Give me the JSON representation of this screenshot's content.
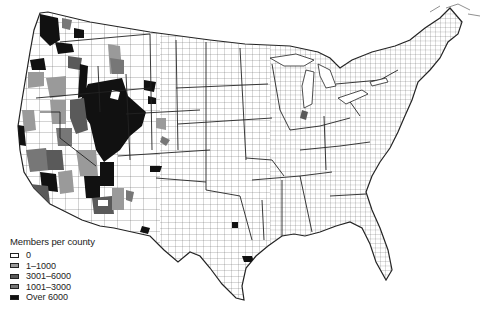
{
  "map": {
    "subject": "Members per county",
    "region": "Contiguous United States, county boundaries"
  },
  "legend": {
    "title": "Members per county",
    "items": [
      {
        "label": "0",
        "color": "#ffffff"
      },
      {
        "label": "1–1000",
        "color": "#9a9a9a"
      },
      {
        "label": "3001–6000",
        "color": "#5a5a5a"
      },
      {
        "label": "1001–3000",
        "color": "#777777"
      },
      {
        "label": "Over 6000",
        "color": "#111111"
      }
    ]
  },
  "colors": {
    "boundary": "#222222",
    "county_line": "#555555",
    "background": "#ffffff"
  }
}
